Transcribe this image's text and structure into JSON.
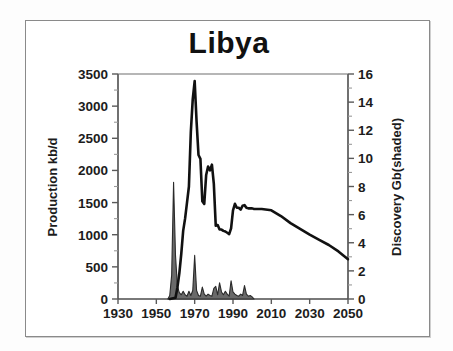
{
  "figure": {
    "background_color": "#ffffff",
    "frame_color": "#8a8a8a"
  },
  "chart_data": {
    "type": "line",
    "title": "Libya",
    "xlabel": "",
    "ylabel": "Production kb/d",
    "y2label": "Discovery Gb(shaded)",
    "grid": false,
    "legend": "none",
    "xlim": [
      1930,
      2050
    ],
    "ylim": [
      0,
      3500
    ],
    "y2lim": [
      0,
      16
    ],
    "xticks": [
      1930,
      1950,
      1970,
      1990,
      2010,
      2030,
      2050
    ],
    "xticklabels": [
      "1930",
      "1950",
      "1970",
      "1990",
      "2010",
      "2030",
      "2050"
    ],
    "yticks": [
      0,
      500,
      1000,
      1500,
      2000,
      2500,
      3000,
      3500
    ],
    "yticklabels": [
      "0",
      "500",
      "1000",
      "1500",
      "2000",
      "2500",
      "3000",
      "3500"
    ],
    "y2ticks": [
      0,
      2,
      4,
      6,
      8,
      10,
      12,
      14,
      16
    ],
    "y2ticklabels": [
      "0",
      "2",
      "4",
      "6",
      "8",
      "10",
      "12",
      "14",
      "16"
    ],
    "y2minorticks": [
      1,
      3,
      5,
      7,
      9,
      11,
      13,
      15
    ],
    "series": [
      {
        "name": "Production kb/d",
        "type": "line",
        "axis": "left",
        "color": "#111111",
        "linewidth": 2.6,
        "x": [
          1957,
          1960,
          1961,
          1962,
          1963,
          1964,
          1965,
          1966,
          1967,
          1968,
          1969,
          1970,
          1971,
          1972,
          1973,
          1974,
          1975,
          1976,
          1977,
          1978,
          1979,
          1980,
          1981,
          1982,
          1983,
          1984,
          1985,
          1986,
          1987,
          1988,
          1989,
          1990,
          1991,
          1992,
          1993,
          1994,
          1995,
          1996,
          1997,
          1998,
          1999,
          2000,
          2001,
          2002,
          2003,
          2004,
          2005,
          2010,
          2015,
          2020,
          2025,
          2030,
          2035,
          2040,
          2045,
          2050
        ],
        "y": [
          0,
          20,
          180,
          400,
          700,
          1060,
          1250,
          1500,
          1750,
          2600,
          3110,
          3390,
          2760,
          2240,
          2180,
          1520,
          1480,
          1930,
          2060,
          2000,
          2090,
          1790,
          1140,
          1150,
          1080,
          1080,
          1060,
          1050,
          1030,
          1010,
          1100,
          1380,
          1480,
          1420,
          1420,
          1390,
          1450,
          1460,
          1420,
          1410,
          1410,
          1410,
          1400,
          1400,
          1400,
          1400,
          1400,
          1380,
          1290,
          1180,
          1090,
          1000,
          920,
          840,
          740,
          620
        ]
      },
      {
        "name": "Discovery Gb(shaded)",
        "type": "area",
        "axis": "right",
        "color": "#6a6a6a",
        "edgecolor": "#2a2a2a",
        "x": [
          1956,
          1957,
          1958,
          1959,
          1960,
          1961,
          1962,
          1963,
          1964,
          1965,
          1966,
          1967,
          1968,
          1969,
          1970,
          1971,
          1972,
          1973,
          1974,
          1975,
          1976,
          1977,
          1978,
          1979,
          1980,
          1981,
          1982,
          1983,
          1984,
          1985,
          1986,
          1987,
          1988,
          1989,
          1990,
          1991,
          1992,
          1993,
          1994,
          1995,
          1996,
          1997,
          1998,
          1999,
          2000,
          2001
        ],
        "y": [
          0,
          0.25,
          1.7,
          8.3,
          3.1,
          0.9,
          0.45,
          0.3,
          0.55,
          0.3,
          0.2,
          0.55,
          0.25,
          0.6,
          3.1,
          0.6,
          0.25,
          0.2,
          0.85,
          0.35,
          0.2,
          0.35,
          0.25,
          0.2,
          0.75,
          0.9,
          0.3,
          1.15,
          0.5,
          0.3,
          0.55,
          0.35,
          0.2,
          1.3,
          0.5,
          0.35,
          0.25,
          0.2,
          0.35,
          0.25,
          0.95,
          0.35,
          0.2,
          0.25,
          0.15,
          0.0
        ]
      }
    ],
    "annotations": [
      {
        "label": "peak production",
        "x": 1970,
        "y": 3390
      },
      {
        "label": "largest discovery",
        "x": 1959,
        "y2": 8.3
      }
    ]
  }
}
